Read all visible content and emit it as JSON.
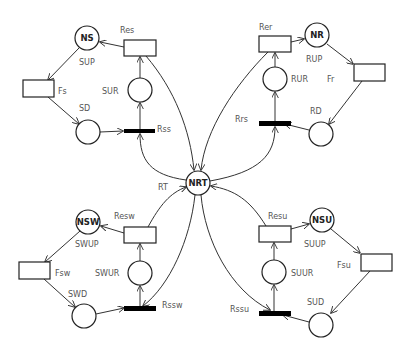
{
  "diagram": {
    "type": "petri-net",
    "places": [
      {
        "id": "NS",
        "label": "NS",
        "cx": 87,
        "cy": 38
      },
      {
        "id": "SD",
        "label": "",
        "cx": 88,
        "cy": 132
      },
      {
        "id": "SUR",
        "label": "",
        "cx": 140,
        "cy": 90
      },
      {
        "id": "NR",
        "label": "NR",
        "cx": 317,
        "cy": 35
      },
      {
        "id": "RUR",
        "label": "",
        "cx": 275,
        "cy": 79
      },
      {
        "id": "RD",
        "label": "",
        "cx": 321,
        "cy": 134
      },
      {
        "id": "NRT",
        "label": "NRT",
        "cx": 198,
        "cy": 183
      },
      {
        "id": "NSW",
        "label": "NSW",
        "cx": 88,
        "cy": 222
      },
      {
        "id": "SWUR",
        "label": "",
        "cx": 140,
        "cy": 273
      },
      {
        "id": "SWD",
        "label": "",
        "cx": 84,
        "cy": 316
      },
      {
        "id": "NSU",
        "label": "NSU",
        "cx": 322,
        "cy": 220
      },
      {
        "id": "SUUR",
        "label": "",
        "cx": 274,
        "cy": 272
      },
      {
        "id": "SUD",
        "label": "",
        "cx": 321,
        "cy": 325
      }
    ],
    "transitions": [
      {
        "id": "Res",
        "x": 124,
        "y": 40,
        "w": 32,
        "h": 16
      },
      {
        "id": "Fs",
        "x": 23,
        "y": 80,
        "w": 31,
        "h": 17
      },
      {
        "id": "Rer",
        "x": 259,
        "y": 36,
        "w": 32,
        "h": 16
      },
      {
        "id": "Fr",
        "x": 354,
        "y": 64,
        "w": 31,
        "h": 17
      },
      {
        "id": "Resw",
        "x": 124,
        "y": 227,
        "w": 32,
        "h": 16
      },
      {
        "id": "Fsw",
        "x": 19,
        "y": 262,
        "w": 31,
        "h": 17
      },
      {
        "id": "Resu",
        "x": 259,
        "y": 226,
        "w": 32,
        "h": 16
      },
      {
        "id": "Fsu",
        "x": 361,
        "y": 254,
        "w": 31,
        "h": 17
      }
    ],
    "immediate_transitions": [
      {
        "id": "Rss",
        "x": 124,
        "y": 129,
        "w": 31,
        "h": 4
      },
      {
        "id": "Rrs",
        "x": 259,
        "y": 121,
        "w": 32,
        "h": 5
      },
      {
        "id": "Rssw",
        "x": 124,
        "y": 306,
        "w": 32,
        "h": 5
      },
      {
        "id": "Rssu",
        "x": 259,
        "y": 311,
        "w": 32,
        "h": 5
      }
    ],
    "labels": {
      "Res": "Res",
      "SUP": "SUP",
      "Fs": "Fs",
      "SD": "SD",
      "SUR": "SUR",
      "Rss": "Rss",
      "Rer": "Rer",
      "RUP": "RUP",
      "RUR": "RUR",
      "Fr": "Fr",
      "RD": "RD",
      "Rrs": "Rrs",
      "RT": "RT",
      "Resw": "Resw",
      "SWUP": "SWUP",
      "Fsw": "Fsw",
      "SWUR": "SWUR",
      "SWD": "SWD",
      "Rssw": "Rssw",
      "Resu": "Resu",
      "SUUP": "SUUP",
      "Fsu": "Fsu",
      "SUUR": "SUUR",
      "SUD": "SUD",
      "Rssu": "Rssu"
    },
    "place_labels": {
      "NS": "NS",
      "NR": "NR",
      "NRT": "NRT",
      "NSW": "NSW",
      "NSU": "NSU"
    }
  }
}
